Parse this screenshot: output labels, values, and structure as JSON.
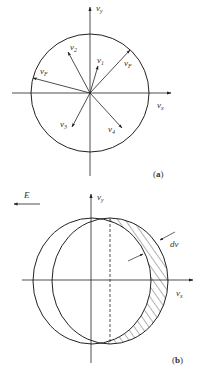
{
  "panel_a": {
    "label": "a",
    "axes": {
      "x_label_base": "v",
      "x_label_sub": "x",
      "y_label_base": "v",
      "y_label_sub": "y"
    },
    "vectors": [
      {
        "name": "v1",
        "base": "v",
        "sub": "1"
      },
      {
        "name": "v2",
        "base": "v",
        "sub": "2"
      },
      {
        "name": "v3",
        "base": "v",
        "sub": "3"
      },
      {
        "name": "v4",
        "base": "v",
        "sub": "4"
      },
      {
        "name": "vF_right",
        "base": "v",
        "sub": "F"
      },
      {
        "name": "vF_left",
        "base": "v",
        "sub": "F"
      }
    ]
  },
  "panel_b": {
    "label": "b",
    "field_label": "E",
    "shift_label": "dv",
    "axes": {
      "x_label_base": "v",
      "x_label_sub": "x",
      "y_label_base": "v",
      "y_label_sub": "y"
    }
  },
  "colors": {
    "stroke": "#222222",
    "text": "#333333",
    "background": "#ffffff"
  }
}
